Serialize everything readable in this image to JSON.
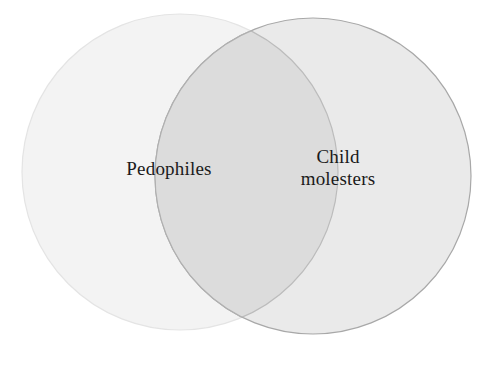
{
  "diagram": {
    "type": "venn",
    "sets": 2,
    "background_color": "#ffffff",
    "left_set": {
      "label": "Pedophiles",
      "fill_color": "#f3f3f3",
      "stroke_color": "#e2e2e2",
      "center_x": 180,
      "center_y": 172,
      "radius": 158
    },
    "right_set": {
      "label": "Child\nmolesters",
      "fill_color": "#eaeaea",
      "stroke_color": "#a8a8a8",
      "center_x": 313,
      "center_y": 176,
      "radius": 158
    },
    "intersection": {
      "label": "",
      "fill_color": "#dcdcdc",
      "stroke_color": "#b4b4b4"
    },
    "text_color": "#1a1a1a"
  }
}
